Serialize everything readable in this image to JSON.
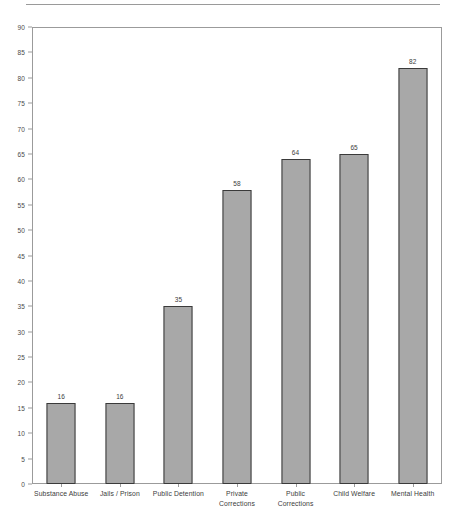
{
  "chart_data": {
    "type": "bar",
    "title": "",
    "subtitle": "",
    "xlabel": "",
    "ylabel": "",
    "categories": [
      "Substance Abuse",
      "Jails / Prison",
      "Public Detention",
      "Private Corrections",
      "Public Corrections",
      "Child Welfare",
      "Mental Health"
    ],
    "values": [
      16,
      16,
      35,
      58,
      64,
      65,
      82
    ],
    "data_labels": [
      "16",
      "16",
      "35",
      "58",
      "64",
      "65",
      "82"
    ],
    "ylim": [
      0,
      90
    ],
    "ytick_step": 5,
    "yticks": [
      0,
      5,
      10,
      15,
      20,
      25,
      30,
      35,
      40,
      45,
      50,
      55,
      60,
      65,
      70,
      75,
      80,
      85,
      90
    ],
    "ytick_labels": [
      "0",
      "5",
      "10",
      "15",
      "20",
      "25",
      "30",
      "35",
      "40",
      "45",
      "50",
      "55",
      "60",
      "65",
      "70",
      "75",
      "80",
      "85",
      "90"
    ],
    "grid": false,
    "legend": null,
    "legend_position": "none",
    "bar_color": "#a8a8a8",
    "bar_outline_color": "#3a3a3a",
    "axis_color": "#9b9b9b",
    "text_color": "#3c3c3c"
  },
  "page": {
    "background": "#ffffff",
    "rule_color": "#9a9a9a"
  }
}
